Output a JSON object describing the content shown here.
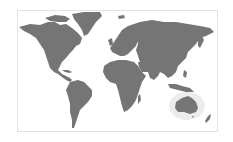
{
  "map": {
    "title": "World map",
    "projection": "equirectangular",
    "land_color": "#757575",
    "background_color": "#ffffff",
    "frame_color": "#e2e2e2",
    "highlight": {
      "region": "Australia",
      "glow_color": "#ececec"
    },
    "regions": [
      {
        "name": "North America"
      },
      {
        "name": "Greenland"
      },
      {
        "name": "South America"
      },
      {
        "name": "Europe"
      },
      {
        "name": "Africa"
      },
      {
        "name": "Asia"
      },
      {
        "name": "Australia"
      },
      {
        "name": "New Zealand"
      }
    ]
  }
}
